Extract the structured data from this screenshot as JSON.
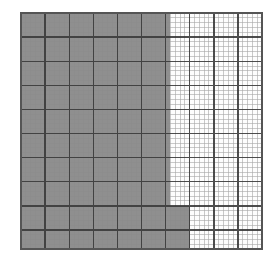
{
  "figure": {
    "name": "graph-paper-shaded-region",
    "title": "Graph paper grid with shaded region",
    "background_color": "#ffffff"
  },
  "chart_data": {
    "type": "heatmap",
    "title": "Graph paper grid with shaded region",
    "subtitle": "",
    "xlabel": "",
    "ylabel": "",
    "grid": true,
    "legend_position": "none",
    "x": [],
    "categories": [],
    "values": [],
    "axis": {
      "x_range": [
        0,
        50
      ],
      "y_range": [
        0,
        49
      ],
      "x_tick_labels": [],
      "y_tick_labels": []
    },
    "annotations": []
  },
  "grid": {
    "origin_x": 21,
    "origin_y": 13,
    "cell_size": 4.82,
    "columns": 50,
    "rows": 49,
    "major_every": 5,
    "minor_line_color": "#8a8a8a",
    "major_line_color": "#3a3a3a",
    "border_color": "#555555",
    "minor_line_width": 0.6,
    "major_line_width": 1.4,
    "border_line_width": 1.4,
    "unshaded_fill": "#fdfdfd"
  },
  "shaded_region": {
    "label": "shaded-region",
    "fill_color": "#8f8f8f",
    "opacity": 1,
    "description": "L-shaped step region occupying the left portion of the grid plus an extension across the lower rows",
    "columns_main": 31,
    "rows_main": 49,
    "columns_extension": 35,
    "rows_extension": 9,
    "polygon_cells": [
      [
        0,
        0
      ],
      [
        31,
        0
      ],
      [
        31,
        40
      ],
      [
        35,
        40
      ],
      [
        35,
        49
      ],
      [
        0,
        49
      ]
    ],
    "area_cells": 1555
  }
}
